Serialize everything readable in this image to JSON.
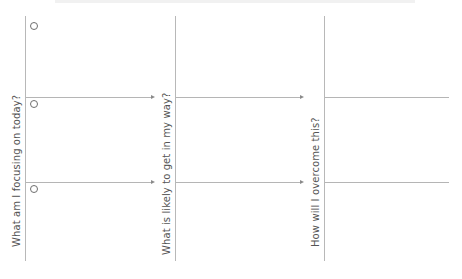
{
  "diagram": {
    "columns": [
      {
        "label": "What am I focusing on today?"
      },
      {
        "label": "What is likely to get in my way?"
      },
      {
        "label": "How will I overcome this?"
      }
    ],
    "rows": 2,
    "colors": {
      "line": "#b5b5b5",
      "arrow": "#8a8a8a",
      "text": "#555555",
      "circle": "#6e6e6e"
    }
  }
}
